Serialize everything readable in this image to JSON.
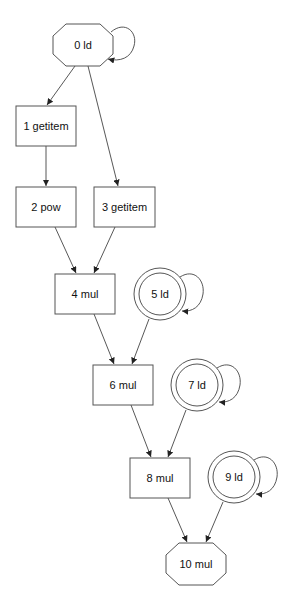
{
  "diagram": {
    "type": "dataflow-graph",
    "nodes": [
      {
        "id": 0,
        "label": "0 ld",
        "shape": "octagon",
        "cx": 83,
        "cy": 45,
        "w": 60,
        "h": 42,
        "self_loop": true
      },
      {
        "id": 1,
        "label": "1 getitem",
        "shape": "box",
        "x": 16,
        "y": 106,
        "w": 60,
        "h": 40
      },
      {
        "id": 2,
        "label": "2 pow",
        "shape": "box",
        "x": 16,
        "y": 187,
        "w": 60,
        "h": 40
      },
      {
        "id": 3,
        "label": "3 getitem",
        "shape": "box",
        "x": 94,
        "y": 187,
        "w": 61,
        "h": 40
      },
      {
        "id": 4,
        "label": "4 mul",
        "shape": "box",
        "x": 55,
        "y": 274,
        "w": 60,
        "h": 40
      },
      {
        "id": 5,
        "label": "5 ld",
        "shape": "doublecircle",
        "cx": 160,
        "cy": 294,
        "r_outer": 26,
        "r_inner": 21,
        "self_loop": true
      },
      {
        "id": 6,
        "label": "6 mul",
        "shape": "box",
        "x": 93,
        "y": 365,
        "w": 60,
        "h": 40
      },
      {
        "id": 7,
        "label": "7 ld",
        "shape": "doublecircle",
        "cx": 197,
        "cy": 385,
        "r_outer": 26,
        "r_inner": 21,
        "self_loop": true
      },
      {
        "id": 8,
        "label": "8 mul",
        "shape": "box",
        "x": 130,
        "y": 458,
        "w": 60,
        "h": 40
      },
      {
        "id": 9,
        "label": "9 ld",
        "shape": "doublecircle",
        "cx": 234,
        "cy": 477,
        "r_outer": 26,
        "r_inner": 21,
        "self_loop": true
      },
      {
        "id": 10,
        "label": "10 mul",
        "shape": "octagon",
        "cx": 196,
        "cy": 564,
        "w": 60,
        "h": 42
      }
    ],
    "edges": [
      {
        "from": 0,
        "to": 0
      },
      {
        "from": 0,
        "to": 1
      },
      {
        "from": 0,
        "to": 3
      },
      {
        "from": 1,
        "to": 2
      },
      {
        "from": 2,
        "to": 4
      },
      {
        "from": 3,
        "to": 4
      },
      {
        "from": 4,
        "to": 6
      },
      {
        "from": 5,
        "to": 5
      },
      {
        "from": 5,
        "to": 6
      },
      {
        "from": 6,
        "to": 8
      },
      {
        "from": 7,
        "to": 7
      },
      {
        "from": 7,
        "to": 8
      },
      {
        "from": 8,
        "to": 10
      },
      {
        "from": 9,
        "to": 9
      },
      {
        "from": 9,
        "to": 10
      }
    ]
  },
  "labels": {
    "n0": "0 ld",
    "n1": "1 getitem",
    "n2": "2 pow",
    "n3": "3 getitem",
    "n4": "4 mul",
    "n5": "5 ld",
    "n6": "6 mul",
    "n7": "7 ld",
    "n8": "8 mul",
    "n9": "9 ld",
    "n10": "10 mul"
  },
  "colors": {
    "background": "#ffffff",
    "stroke": "#555555",
    "edge": "#444444",
    "text": "#111111"
  }
}
